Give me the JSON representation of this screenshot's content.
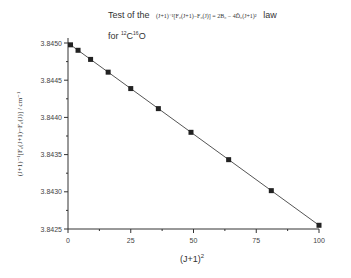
{
  "title": {
    "line1_prefix": "Test of the",
    "equation": "(J+1)⁻¹[F₀(J+1)−F₀(J)] = 2B₀ − 4D̂₀(J+1)²",
    "line1_suffix": "law",
    "line2_prefix": "for",
    "isotope_c": "12",
    "c": "C",
    "isotope_o": "16",
    "o": "O"
  },
  "axes": {
    "ylabel": "(J+1)⁻¹[F₀(J+1)−F₀(J)] / cm⁻¹",
    "xlabel_base": "(J+1)",
    "xlabel_sup": "2"
  },
  "chart_data": {
    "type": "scatter",
    "xlabel": "(J+1)^2",
    "ylabel": "(J+1)^-1[F0(J+1)-F0(J)] / cm^-1",
    "xlim": [
      0,
      100
    ],
    "ylim": [
      3.8425,
      3.8451
    ],
    "x_ticks": [
      "0",
      "25",
      "50",
      "75",
      "100"
    ],
    "y_ticks": [
      "3.8425",
      "3.8430",
      "3.8435",
      "3.8440",
      "3.8445",
      "3.8450"
    ],
    "grid": false,
    "legend": null,
    "series": [
      {
        "name": "data",
        "marker": "square",
        "x": [
          1,
          4,
          9,
          16,
          25,
          36,
          49,
          64,
          81,
          100
        ],
        "y": [
          3.84496,
          3.84482,
          3.84467,
          3.84443,
          3.84416,
          3.84383,
          3.84347,
          3.84305,
          3.8426,
          3.84256
        ]
      }
    ],
    "fit_line": {
      "x": [
        0,
        100
      ],
      "y": [
        3.845,
        3.84255
      ]
    }
  }
}
